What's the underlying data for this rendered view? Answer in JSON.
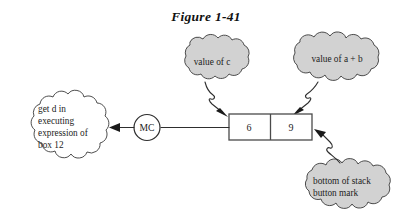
{
  "figure": {
    "title": "Figure 1-41",
    "background_color": "#ffffff",
    "cloud_fill_gray": "#d2d2d2",
    "cloud_fill_white": "#ffffff",
    "line_color": "#2e2e2e"
  },
  "stack": {
    "name": "stack-box",
    "cells": [
      {
        "value": "6"
      },
      {
        "value": "9"
      }
    ]
  },
  "node": {
    "label": "MC"
  },
  "callouts": [
    {
      "id": "value-of-c",
      "text": "value of c",
      "lines": [
        "value of c"
      ],
      "fill": "#d2d2d2",
      "align": "center"
    },
    {
      "id": "value-of-a-plus-b",
      "text": "value of a + b",
      "lines": [
        "value of a + b"
      ],
      "fill": "#d2d2d2",
      "align": "center"
    },
    {
      "id": "get-d-note",
      "text": "get d in executing expression of box 12",
      "lines": [
        "get d in",
        "executing",
        "expression of",
        "box 12"
      ],
      "fill": "#ffffff",
      "align": "left"
    },
    {
      "id": "bottom-of-stack",
      "text": "bottom of stack button mark",
      "lines": [
        "bottom of stack",
        "button mark"
      ],
      "fill": "#d2d2d2",
      "align": "left"
    }
  ]
}
